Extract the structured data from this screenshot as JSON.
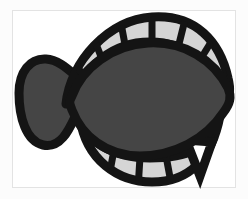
{
  "figure": {
    "subject": "flatfish",
    "common_name": "Flounder",
    "orientation": "facing left",
    "style": "bold stencil outline",
    "alt_text": "Stylized black-outlined flatfish with dark gray body and segmented light gray dorsal and ventral fins"
  },
  "canvas": {
    "width": 248,
    "height": 199,
    "background_color": "#fcfcfc",
    "plate_background_color": "#ffffff",
    "plate_border_color": "#e3e3e3",
    "plate_x": 12,
    "plate_y": 10,
    "plate_width": 224,
    "plate_height": 178
  },
  "palette": {
    "outline": "#141414",
    "body_fill": "#454545",
    "fin_cell_fill": "#d5d5d5",
    "paper": "#ffffff"
  },
  "geometry": {
    "outline_width": 8,
    "fin_ray_width": 6,
    "body": {
      "left_x": 62,
      "right_x": 226,
      "top_y": 46,
      "bottom_y": 152,
      "path": "M 74 92 C 84 66, 112 48, 146 46 C 180 45, 210 62, 224 88 C 228 96, 226 104, 220 112 C 204 136, 172 152, 140 152 C 108 152, 84 134, 74 110 C 71 102, 71 99, 74 92 Z"
    },
    "tail": {
      "left_x": 21,
      "right_x": 80,
      "top_y": 62,
      "bottom_y": 142,
      "path": "M 76 86 C 68 80, 58 66, 46 64 C 32 62, 22 74, 22 92 C 22 114, 28 136, 42 140 C 56 144, 64 128, 70 116 C 74 108, 78 100, 80 96 Z"
    },
    "dorsal_fin": {
      "cell_count": 7,
      "start_x": 66,
      "end_x": 218,
      "crest_y": 22,
      "outer_path": "M 72 96 C 78 62, 112 24, 152 21 C 192 18, 216 44, 224 78 C 226 86, 226 90, 224 92 C 212 62, 186 44, 152 44 C 114 44, 86 64, 74 96 Z"
    },
    "ventral_fin": {
      "cell_count": 6,
      "start_x": 84,
      "end_x": 214,
      "trough_y": 178,
      "outer_path": "M 84 124 C 92 158, 120 178, 152 178 C 186 178, 208 156, 216 120 C 212 146, 184 154, 150 154 C 114 154, 92 142, 84 124 Z"
    },
    "caudal_notch": {
      "x": 192,
      "y": 150,
      "width": 22,
      "height": 30,
      "description": "pointed spike where ventral fin meets caudal region"
    }
  },
  "fin_rays": {
    "dorsal_angles_deg": [
      202,
      216,
      232,
      250,
      268,
      286,
      302
    ],
    "ventral_angles_deg": [
      158,
      142,
      124,
      106,
      88,
      70
    ]
  }
}
